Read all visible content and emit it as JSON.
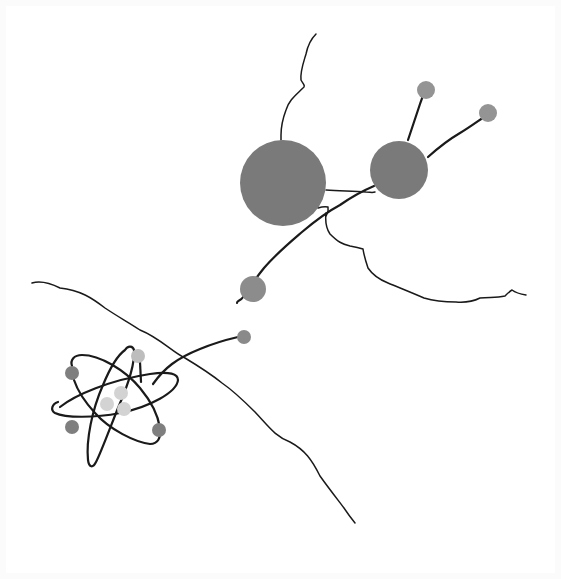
{
  "artwork": {
    "title": "Atom and molecules line illustration",
    "description": "Hand-drawn scientific illustration: an atom with three elliptical electron orbits, connected by wavy lines to a diatomic molecule and small gray particles.",
    "colors": {
      "background": "#ffffff",
      "border": "#fbfbfb",
      "line": "#1a1a1a",
      "large_sphere": "#7a7a7a",
      "medium_particle": "#8c8c8c",
      "small_particle": "#949494",
      "dark_electron": "#7f7f7f",
      "light_electron": "#bdbdbd",
      "nucleus_proton": "#d3d3d3"
    }
  },
  "molecule": {
    "large_sphere": {
      "cx": 283,
      "cy": 183,
      "r": 43
    },
    "medium_sphere": {
      "cx": 399,
      "cy": 170,
      "r": 29
    },
    "antenna_particles": [
      {
        "cx": 426,
        "cy": 90,
        "r": 9
      },
      {
        "cx": 488,
        "cy": 113,
        "r": 9
      }
    ]
  },
  "free_particles": [
    {
      "cx": 253,
      "cy": 289,
      "r": 13
    },
    {
      "cx": 244,
      "cy": 337,
      "r": 7
    }
  ],
  "atom": {
    "nucleus": [
      {
        "cx": 121,
        "cy": 393,
        "r": 7
      },
      {
        "cx": 107,
        "cy": 404,
        "r": 7
      },
      {
        "cx": 124,
        "cy": 409,
        "r": 7
      }
    ],
    "electrons": [
      {
        "cx": 72,
        "cy": 373,
        "r": 7,
        "tone": "dark"
      },
      {
        "cx": 138,
        "cy": 356,
        "r": 7,
        "tone": "light"
      },
      {
        "cx": 72,
        "cy": 427,
        "r": 7,
        "tone": "dark"
      },
      {
        "cx": 159,
        "cy": 430,
        "r": 7,
        "tone": "dark"
      }
    ]
  }
}
